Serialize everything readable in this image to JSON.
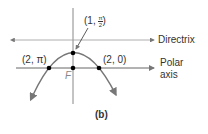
{
  "figure": {
    "caption": "(b)",
    "lines": {
      "directrix_label": "Directrix",
      "polar_axis_label_line1": "Polar",
      "polar_axis_label_line2": "axis"
    },
    "focus_label": "F",
    "points": [
      {
        "label": "(2, π)",
        "pixel": [
          49,
          68
        ]
      },
      {
        "label_prefix": "(1, ",
        "frac_num": "π",
        "frac_den": "2",
        "label_suffix": ")",
        "pixel": [
          73,
          53
        ]
      },
      {
        "label": "(2, 0)",
        "pixel": [
          99,
          68
        ]
      },
      {
        "label": "",
        "pixel": [
          73,
          68
        ]
      }
    ],
    "colors": {
      "lines": "#888888",
      "curve": "#777777",
      "points": "#000000",
      "text": "#333333"
    }
  }
}
